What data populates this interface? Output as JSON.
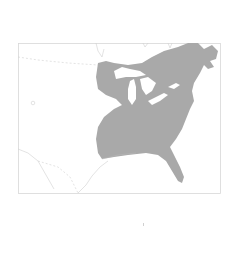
{
  "map": {
    "region": "Eastern North America",
    "range_fill": "#a9a9a9",
    "water_color": "#ffffff",
    "border_color": "#cfcfcf",
    "frame_color": "#d8d8d8",
    "features": [
      "range-area",
      "great-lakes",
      "state-borders",
      "coastline",
      "canada-us-border",
      "mexico-us-border"
    ]
  }
}
